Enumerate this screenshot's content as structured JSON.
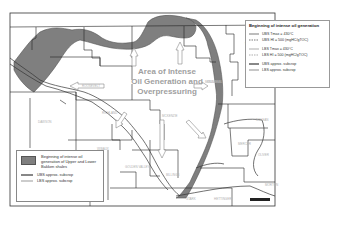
{
  "map": {
    "center_label": [
      "Area of Intense",
      "Oil Generation and",
      "Overpressuring"
    ],
    "colors": {
      "band_fill": "#7f7f7f",
      "band_stroke": "#555555",
      "county_line": "#222222",
      "center_text": "#a0a0a0",
      "background": "#ffffff"
    },
    "county_labels": [
      {
        "text": "ROOSEVELT",
        "x": 82,
        "y": 84
      },
      {
        "text": "RICHLAND",
        "x": 102,
        "y": 111
      },
      {
        "text": "MCKENZIE",
        "x": 162,
        "y": 114
      },
      {
        "text": "MOUNTRAIL",
        "x": 205,
        "y": 80
      },
      {
        "text": "WARD",
        "x": 245,
        "y": 42
      },
      {
        "text": "WILLIAMS",
        "x": 207,
        "y": 80
      },
      {
        "text": "DAWSON",
        "x": 38,
        "y": 120
      },
      {
        "text": "WIBAUX",
        "x": 97,
        "y": 147
      },
      {
        "text": "GOLDEN VALLEY",
        "x": 125,
        "y": 165
      },
      {
        "text": "BILLINGS",
        "x": 166,
        "y": 173
      },
      {
        "text": "MERCER",
        "x": 238,
        "y": 142
      },
      {
        "text": "OLIVER",
        "x": 258,
        "y": 153
      },
      {
        "text": "MCLEAN",
        "x": 256,
        "y": 118
      },
      {
        "text": "MORTON",
        "x": 265,
        "y": 183
      },
      {
        "text": "STARK",
        "x": 186,
        "y": 197
      },
      {
        "text": "HETTINGER",
        "x": 214,
        "y": 197
      }
    ]
  },
  "legend_top_right": {
    "title": "Beginning of intense oil generation",
    "items": [
      {
        "label": "UBS Tmax = 430°C",
        "style": "solid-thin"
      },
      {
        "label": "UBS  HI = 500 (mgHC/gTOC)",
        "style": "dashed"
      },
      {
        "label": "LBS Tmax = 430°C",
        "style": "solid-thin-gray"
      },
      {
        "label": "LBS  HI = 500 (mgHC/gTOC)",
        "style": "dashed-gray"
      },
      {
        "label": "UBS approx. subcrop",
        "style": "solid-thick"
      },
      {
        "label": "LBS approx. subcrop",
        "style": "solid-thin"
      }
    ]
  },
  "legend_bottom_left": {
    "swatch_label": "Beginning of intense oil generation of Upper and Lower Bakken shales",
    "items": [
      {
        "label": "UBS approx. subcrop"
      },
      {
        "label": "LBS approx. subcrop"
      }
    ]
  }
}
